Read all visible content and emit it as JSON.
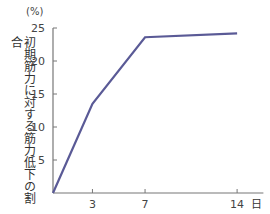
{
  "chart_data": {
    "type": "line",
    "title": "",
    "unit_label": "(%)",
    "ylabel": "初期筋力に対する筋力低下の割合",
    "xlabel": "日",
    "x": [
      0,
      3,
      7,
      14
    ],
    "series": [
      {
        "name": "筋力低下の割合",
        "values": [
          0,
          13.5,
          23.6,
          24.2
        ],
        "color": "#5a5a96"
      }
    ],
    "xticks": [
      3,
      7,
      14
    ],
    "yticks": [
      5,
      10,
      15,
      20,
      25
    ],
    "xlim": [
      0,
      16
    ],
    "ylim": [
      0,
      25
    ],
    "grid": false
  }
}
